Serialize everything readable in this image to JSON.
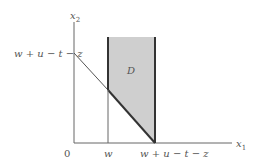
{
  "diagram": {
    "y_axis_label": "x",
    "y_axis_sub": "2",
    "x_axis_label": "x",
    "x_axis_sub": "1",
    "origin_label": "0",
    "y_intercept_label": "w + u − t − z",
    "x_tick_w_label": "w",
    "x_tick_end_label": "w + u − t − z",
    "region_label": "D",
    "colors": {
      "region_fill": "#cfcfcf",
      "axis": "#555555",
      "boundary": "#333333"
    }
  }
}
